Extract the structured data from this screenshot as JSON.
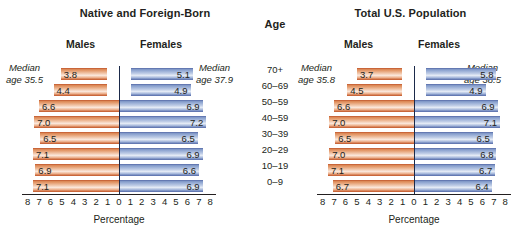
{
  "age_column": {
    "header": "Age",
    "groups": [
      "70+",
      "60–69",
      "50–59",
      "40–59",
      "30–39",
      "20–29",
      "10–19",
      "0–9"
    ]
  },
  "axis": {
    "title": "Percentage",
    "ticks": [
      "8",
      "7",
      "6",
      "5",
      "4",
      "3",
      "2",
      "1",
      "0",
      "1",
      "2",
      "3",
      "4",
      "5",
      "6",
      "7",
      "8"
    ],
    "max": 8
  },
  "panels": [
    {
      "title": "Native and Foreign-Born",
      "male_label": "Males",
      "female_label": "Females",
      "median_male": "Median\nage 35.5",
      "median_male_line1": "Median",
      "median_male_line2": "age 35.5",
      "median_female_line1": "Median",
      "median_female_line2": "age 37.9",
      "males": [
        "3.8",
        "4.4",
        "6.6",
        "7.0",
        "6.5",
        "7.1",
        "6.9",
        "7.1"
      ],
      "females": [
        "5.1",
        "4.9",
        "6.9",
        "7.2",
        "6.5",
        "6.9",
        "6.6",
        "6.9"
      ]
    },
    {
      "title": "Total U.S. Population",
      "male_label": "Males",
      "female_label": "Females",
      "median_male_line1": "Median",
      "median_male_line2": "age 35.8",
      "median_female_line1": "Median",
      "median_female_line2": "age 38.5",
      "males": [
        "3.7",
        "4.5",
        "6.6",
        "7.0",
        "6.5",
        "7.0",
        "7.1",
        "6.7"
      ],
      "females": [
        "5.8",
        "4.9",
        "6.9",
        "7.1",
        "6.5",
        "6.8",
        "6.7",
        "6.4"
      ]
    }
  ],
  "colors": {
    "male_bar": "#e49a6b",
    "female_bar": "#93a9d3",
    "axis_line": "#1b2a4a",
    "text": "#231f20"
  },
  "chart_data": {
    "type": "bar",
    "xlabel": "Percentage",
    "ylabel": "Age",
    "xlim": [
      -8,
      8
    ],
    "grid": false,
    "legend": "none",
    "categories": [
      "70+",
      "60–69",
      "50–59",
      "40–59",
      "30–39",
      "20–29",
      "10–19",
      "0–9"
    ],
    "panels": [
      {
        "name": "Native and Foreign-Born",
        "median_age_males": 35.5,
        "median_age_females": 37.9,
        "series": [
          {
            "name": "Males",
            "values": [
              3.8,
              4.4,
              6.6,
              7.0,
              6.5,
              7.1,
              6.9,
              7.1
            ]
          },
          {
            "name": "Females",
            "values": [
              5.1,
              4.9,
              6.9,
              7.2,
              6.5,
              6.9,
              6.6,
              6.9
            ]
          }
        ]
      },
      {
        "name": "Total U.S. Population",
        "median_age_males": 35.8,
        "median_age_females": 38.5,
        "series": [
          {
            "name": "Males",
            "values": [
              3.7,
              4.5,
              6.6,
              7.0,
              6.5,
              7.0,
              7.1,
              6.7
            ]
          },
          {
            "name": "Females",
            "values": [
              5.8,
              4.9,
              6.9,
              7.1,
              6.5,
              6.8,
              6.7,
              6.4
            ]
          }
        ]
      }
    ]
  }
}
